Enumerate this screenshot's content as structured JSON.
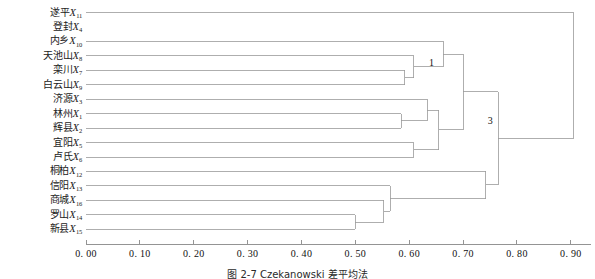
{
  "caption": "图 2-7  Czekanowski 差平均法",
  "chart_data": {
    "type": "dendrogram",
    "title": "图 2-7  Czekanowski 差平均法",
    "xlabel": "",
    "ylabel": "",
    "xlim": [
      0.0,
      0.93
    ],
    "xticks": [
      0.0,
      0.1,
      0.2,
      0.3,
      0.4,
      0.5,
      0.6,
      0.7,
      0.8,
      0.9
    ],
    "xtick_labels": [
      "0. 00",
      "0. 10",
      "0. 20",
      "0. 30",
      "0. 40",
      "0. 50",
      "0. 60",
      "0. 70",
      "0. 80",
      "0. 90"
    ],
    "grid": false,
    "orientation": "horizontal",
    "leaves": [
      {
        "name": "遂平",
        "var": "X",
        "sub": "11",
        "index": 11
      },
      {
        "name": "登封",
        "var": "X",
        "sub": "4",
        "index": 4
      },
      {
        "name": "内乡",
        "var": "X",
        "sub": "10",
        "index": 10
      },
      {
        "name": "天池山",
        "var": "X",
        "sub": "8",
        "index": 8
      },
      {
        "name": "栾川",
        "var": "X",
        "sub": "7",
        "index": 7
      },
      {
        "name": "白云山",
        "var": "X",
        "sub": "9",
        "index": 9
      },
      {
        "name": "济源",
        "var": "X",
        "sub": "3",
        "index": 3
      },
      {
        "name": "林州",
        "var": "X",
        "sub": "1",
        "index": 1
      },
      {
        "name": "辉县",
        "var": "X",
        "sub": "2",
        "index": 2
      },
      {
        "name": "宜阳",
        "var": "X",
        "sub": "5",
        "index": 5
      },
      {
        "name": "卢氏",
        "var": "X",
        "sub": "6",
        "index": 6
      },
      {
        "name": "桐柏",
        "var": "X",
        "sub": "12",
        "index": 12
      },
      {
        "name": "信阳",
        "var": "X",
        "sub": "13",
        "index": 13
      },
      {
        "name": "商城",
        "var": "X",
        "sub": "16",
        "index": 16
      },
      {
        "name": "罗山",
        "var": "X",
        "sub": "14",
        "index": 14
      },
      {
        "name": "新县",
        "var": "X",
        "sub": "15",
        "index": 15
      }
    ],
    "cluster_labels": [
      {
        "text": "1",
        "x": 0.633,
        "leaf_a": 7,
        "leaf_b": 8
      },
      {
        "text": "3",
        "x": 0.742,
        "leaf_a": 11,
        "leaf_b": 15
      }
    ],
    "merges": [
      {
        "id": "m1",
        "height": 0.592,
        "children": [
          "leaf:7",
          "leaf:9"
        ],
        "note": "栾川 X7 + 白云山 X9"
      },
      {
        "id": "m2",
        "height": 0.608,
        "children": [
          "leaf:8",
          "m1"
        ],
        "note": "天池山 X8 + (栾川,白云山)"
      },
      {
        "id": "m3",
        "height": 0.585,
        "children": [
          "leaf:1",
          "leaf:2"
        ],
        "note": "林州 X1 + 辉县 X2"
      },
      {
        "id": "m4",
        "height": 0.633,
        "children": [
          "leaf:3",
          "m3"
        ],
        "note": "济源 X3 + (林州,辉县)"
      },
      {
        "id": "m5",
        "height": 0.608,
        "children": [
          "leaf:5",
          "leaf:6"
        ],
        "note": "宜阳 X5 + 卢氏 X6"
      },
      {
        "id": "m6",
        "height": 0.655,
        "children": [
          "m4",
          "m5"
        ],
        "note": "cluster 1"
      },
      {
        "id": "m7",
        "height": 0.663,
        "children": [
          "leaf:10",
          "m2"
        ],
        "note": "内乡 X10 + 天池山 group"
      },
      {
        "id": "m8",
        "height": 0.7,
        "children": [
          "m7",
          "m6"
        ]
      },
      {
        "id": "m9",
        "height": 0.5,
        "children": [
          "leaf:14",
          "leaf:15"
        ],
        "note": "罗山 X14 + 新县 X15"
      },
      {
        "id": "m10",
        "height": 0.553,
        "children": [
          "leaf:16",
          "m9"
        ],
        "note": "商城 X16 + (罗山,新县)"
      },
      {
        "id": "m11",
        "height": 0.565,
        "children": [
          "leaf:13",
          "m10"
        ],
        "note": "信阳 X13 + group"
      },
      {
        "id": "m12",
        "height": 0.742,
        "children": [
          "leaf:12",
          "m11"
        ],
        "note": "cluster 3"
      },
      {
        "id": "m13",
        "height": 0.765,
        "children": [
          "m8",
          "m12"
        ]
      },
      {
        "id": "m14",
        "height": 0.905,
        "children": [
          "leaf:11",
          "m13"
        ],
        "note": "遂平 X11 joins last"
      }
    ]
  }
}
